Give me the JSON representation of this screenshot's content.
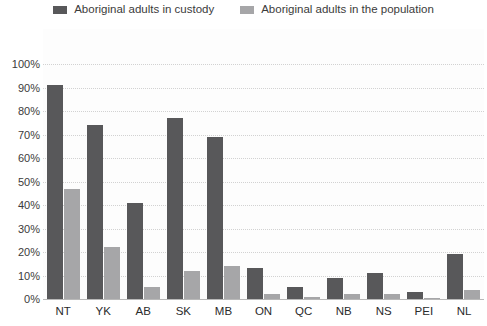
{
  "chart_data": {
    "type": "bar",
    "title": "",
    "xlabel": "",
    "ylabel": "",
    "ylim": [
      0,
      100
    ],
    "grid": true,
    "legend_position": "top",
    "categories": [
      "NT",
      "YK",
      "AB",
      "SK",
      "MB",
      "ON",
      "QC",
      "NB",
      "NS",
      "PEI",
      "NL"
    ],
    "y_ticks": [
      "0%",
      "10%",
      "20%",
      "30%",
      "40%",
      "50%",
      "60%",
      "70%",
      "80%",
      "90%",
      "100%"
    ],
    "y_tick_values": [
      0,
      10,
      20,
      30,
      40,
      50,
      60,
      70,
      80,
      90,
      100
    ],
    "series": [
      {
        "name": "Aboriginal adults in custody",
        "color": "#58585a",
        "values": [
          91,
          74,
          41,
          77,
          69,
          13,
          5,
          9,
          11,
          3,
          19
        ]
      },
      {
        "name": "Aboriginal adults in the population",
        "color": "#a6a6a8",
        "values": [
          47,
          22,
          5,
          12,
          14,
          2,
          1,
          2,
          2,
          0.5,
          4
        ]
      }
    ]
  },
  "colors": {
    "custody": "#58585a",
    "population": "#a6a6a8",
    "gridline": "#d2d2d2",
    "axis": "#b9b9b9",
    "text": "#3b3b3b",
    "background": "#ffffff"
  }
}
